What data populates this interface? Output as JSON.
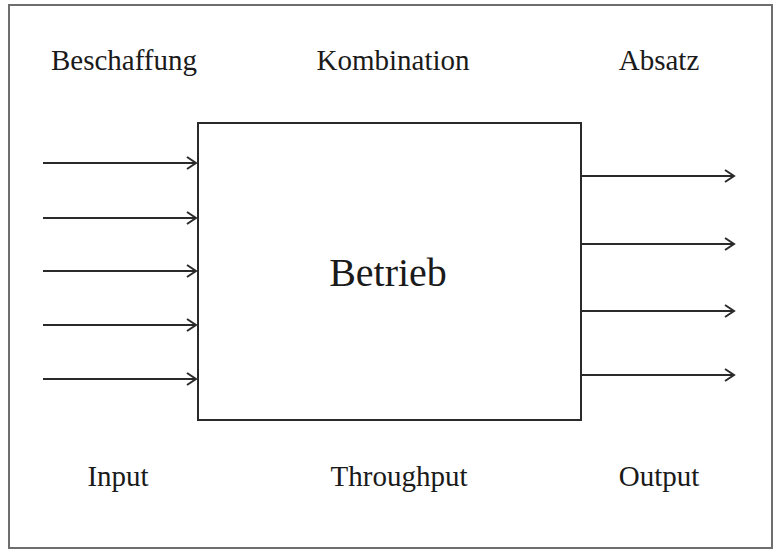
{
  "diagram": {
    "type": "input-throughput-output",
    "top_labels": [
      {
        "text": "Beschaffung",
        "x": 124,
        "y": 46
      },
      {
        "text": "Kombination",
        "x": 393,
        "y": 46
      },
      {
        "text": "Absatz",
        "x": 659,
        "y": 46
      }
    ],
    "center_box": {
      "label": "Betrieb",
      "x": 197,
      "y": 122,
      "width": 385,
      "height": 299
    },
    "input_arrows": {
      "count": 5,
      "x_start": 43,
      "x_end": 197,
      "y_positions": [
        163,
        218,
        271,
        325,
        379
      ]
    },
    "output_arrows": {
      "count": 4,
      "x_start": 581,
      "x_end": 735,
      "y_positions": [
        176,
        244,
        311,
        375
      ]
    },
    "bottom_labels": [
      {
        "text": "Input",
        "x": 118,
        "y": 462
      },
      {
        "text": "Throughput",
        "x": 399,
        "y": 462
      },
      {
        "text": "Output",
        "x": 659,
        "y": 462
      }
    ],
    "colors": {
      "line": "#2a2a2a",
      "frame": "#6e6e6e",
      "text": "#1a1a1a",
      "background": "#ffffff"
    }
  }
}
